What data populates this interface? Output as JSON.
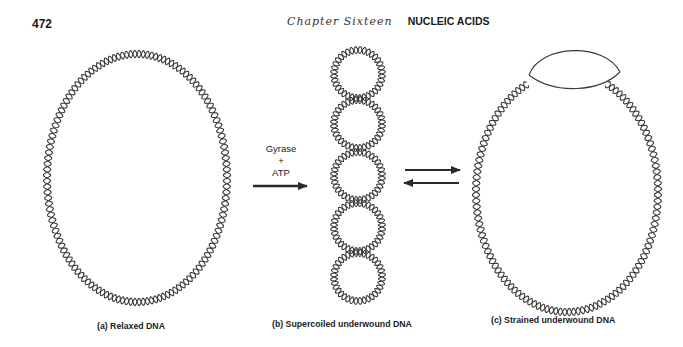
{
  "header": {
    "page_number": "472",
    "chapter": "Chapter Sixteen",
    "section": "NUCLEIC ACIDS"
  },
  "figure": {
    "reaction_arrow": {
      "line1": "Gyrase",
      "line2": "+",
      "line3": "ATP"
    },
    "panels": [
      {
        "id": "a",
        "caption": "(a) Relaxed DNA"
      },
      {
        "id": "b",
        "caption": "(b) Supercoiled underwound DNA"
      },
      {
        "id": "c",
        "caption": "(c) Strained underwound DNA"
      }
    ],
    "equilibrium_arrows": "reversible",
    "colors": {
      "strand": "#3a3a3a",
      "arrow": "#2a2a2a",
      "background": "#ffffff"
    }
  }
}
